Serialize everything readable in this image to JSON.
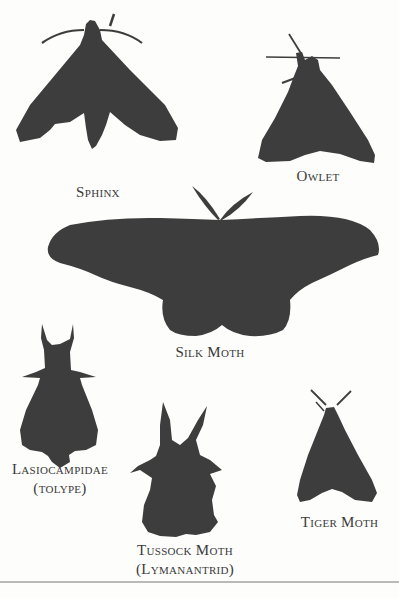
{
  "plate": {
    "silhouette_color": "#3d3d3d",
    "background_color": "#fdfdfc",
    "moths": [
      {
        "id": "sphinx",
        "label": "Sphinx"
      },
      {
        "id": "owlet",
        "label": "Owlet"
      },
      {
        "id": "silk-moth",
        "label": "Silk Moth"
      },
      {
        "id": "lasiocampidae",
        "label": "Lasiocampidae",
        "sublabel": "(tolype)"
      },
      {
        "id": "tussock-moth",
        "label": "Tussock Moth",
        "sublabel": "(Lymanantrid)"
      },
      {
        "id": "tiger-moth",
        "label": "Tiger Moth"
      }
    ]
  }
}
